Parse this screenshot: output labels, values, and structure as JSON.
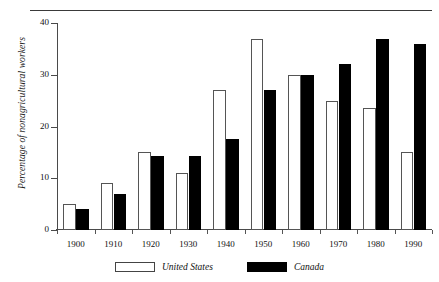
{
  "chart_data": {
    "type": "bar",
    "title": "",
    "xlabel": "",
    "ylabel": "Percentage of nonagricultural workers",
    "categories": [
      "1900",
      "1910",
      "1920",
      "1930",
      "1940",
      "1950",
      "1960",
      "1970",
      "1980",
      "1990"
    ],
    "series": [
      {
        "name": "United States",
        "color": "#ffffff",
        "values": [
          5,
          9,
          15,
          11,
          27,
          37,
          30,
          25,
          23.5,
          15
        ]
      },
      {
        "name": "Canada",
        "color": "#000000",
        "values": [
          4,
          7,
          14.3,
          14.3,
          17.5,
          27,
          30,
          32,
          37,
          36
        ]
      }
    ],
    "ylim": [
      0,
      40
    ],
    "yticks": [
      0,
      10,
      20,
      30,
      40
    ],
    "grid": false,
    "legend_position": "bottom"
  },
  "legend": {
    "entries": [
      {
        "label": "United States",
        "swatch": "white-outlined-swatch"
      },
      {
        "label": "Canada",
        "swatch": "black-filled-swatch"
      }
    ]
  }
}
